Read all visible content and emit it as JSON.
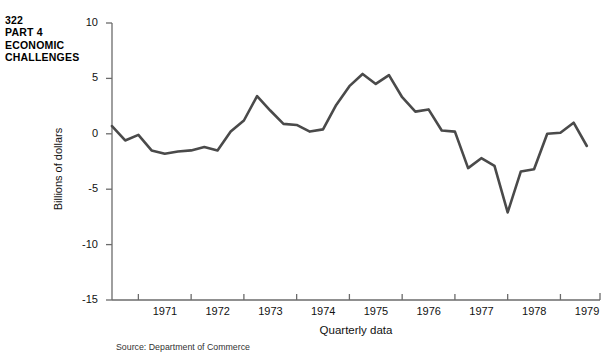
{
  "running_head": {
    "page_number": "322",
    "part": "PART 4",
    "section_line_1": "ECONOMIC",
    "section_line_2": "CHALLENGES"
  },
  "figure": {
    "source_note": "Source: Department of Commerce",
    "line_color": "#4a4a4a",
    "axis_color": "#6b6b6b"
  },
  "chart_data": {
    "type": "line",
    "title": "",
    "xlabel": "Quarterly data",
    "ylabel": "Billions of dollars",
    "ylim": [
      -15,
      10
    ],
    "y_ticks": [
      10,
      5,
      0,
      -5,
      -10,
      -15
    ],
    "y_tick_labels": [
      "10",
      "5",
      "0",
      "-5",
      "-10",
      "-15"
    ],
    "xlim": [
      1970.5,
      1979.75
    ],
    "x_ticks": [
      1971,
      1972,
      1973,
      1974,
      1975,
      1976,
      1977,
      1978,
      1979
    ],
    "x_tick_labels": [
      "1971",
      "1972",
      "1973",
      "1974",
      "1975",
      "1976",
      "1977",
      "1978",
      "1979"
    ],
    "grid": false,
    "legend": false,
    "series": [
      {
        "name": "Net exports of goods and services",
        "x": [
          1970.5,
          1970.75,
          1971.0,
          1971.25,
          1971.5,
          1971.75,
          1972.0,
          1972.25,
          1972.5,
          1972.75,
          1973.0,
          1973.25,
          1973.5,
          1973.75,
          1974.0,
          1974.25,
          1974.5,
          1974.75,
          1975.0,
          1975.25,
          1975.5,
          1975.75,
          1976.0,
          1976.25,
          1976.5,
          1976.75,
          1977.0,
          1977.25,
          1977.5,
          1977.75,
          1978.0,
          1978.25,
          1978.5,
          1978.75,
          1979.0,
          1979.25,
          1979.5
        ],
        "y": [
          0.7,
          -0.6,
          -0.1,
          -1.5,
          -1.8,
          -1.6,
          -1.5,
          -1.2,
          -1.5,
          0.2,
          1.2,
          3.4,
          2.1,
          0.9,
          0.8,
          0.2,
          0.4,
          2.6,
          4.3,
          5.4,
          4.5,
          5.3,
          3.3,
          2.0,
          2.2,
          0.3,
          0.2,
          -3.1,
          -2.2,
          -2.9,
          -7.1,
          -3.4,
          -3.2,
          0.0,
          0.1,
          1.0,
          -1.1
        ]
      }
    ]
  }
}
